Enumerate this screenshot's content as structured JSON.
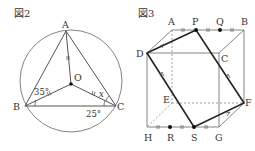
{
  "figure2": {
    "title": "図2",
    "points": {
      "A": "A",
      "B": "B",
      "C": "C",
      "O": "O"
    },
    "angles": {
      "ABO": "35°",
      "OCB": "25°",
      "OCA": "x"
    }
  },
  "figure3": {
    "title": "図3",
    "vertices": {
      "A": "A",
      "B": "B",
      "C": "C",
      "D": "D",
      "E": "E",
      "F": "F",
      "G": "G",
      "H": "H"
    },
    "points": {
      "P": "P",
      "Q": "Q",
      "R": "R",
      "S": "S"
    }
  },
  "colors": {
    "line": "#666666",
    "bold": "#222222",
    "text": "#333333"
  }
}
